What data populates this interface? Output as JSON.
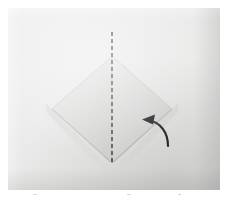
{
  "page": {
    "background_color": "#ffffff",
    "width": 228,
    "height": 208
  },
  "photo": {
    "subject": "origami paper fold step",
    "paper_color": "#e2e3e1",
    "shadow_color": "#cdcecc",
    "background_surface_color": "#e6e7e5",
    "alt": "Photograph of a square sheet of light grey paper folded into a downward pointing diamond, with a vertical dashed valley fold line and a curved fold arrow."
  },
  "figure": {
    "dashed_line": {
      "label": "valley fold line",
      "color": "#2b2b2b",
      "dash_pattern": "4 3",
      "x": 104,
      "y_top": 24,
      "y_bottom": 155
    },
    "diamond": {
      "label": "folded paper diamond",
      "fill_color": "#dcdddb",
      "edge_color": "#c6c7c5",
      "top_y": 48,
      "left_x": 44,
      "right_x": 164,
      "bottom_y": 155,
      "center_x": 104,
      "mid_y": 101
    },
    "arrow": {
      "label": "fold-over arrow",
      "direction": "right-to-left curving upward",
      "color": "#111111",
      "tip_x": 136,
      "tip_y": 113,
      "tail_x": 160,
      "tail_y": 136
    }
  },
  "caption": {
    "text": "origami fold the left and right corners up to the center",
    "visible": "cropped - only the tops of the letters are rendered",
    "color": "#9a9a9a"
  }
}
